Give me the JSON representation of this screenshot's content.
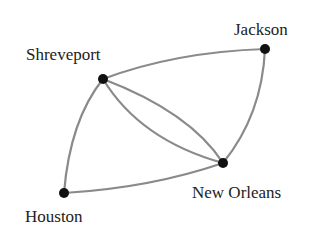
{
  "diagram": {
    "type": "graph",
    "colors": {
      "edge": "#8a8a8a",
      "node": "#111111",
      "label": "#222222",
      "background": "#ffffff"
    },
    "nodes": [
      {
        "id": "shreveport",
        "label": "Shreveport",
        "x": 103,
        "y": 79,
        "label_x": 26,
        "label_y": 60
      },
      {
        "id": "jackson",
        "label": "Jackson",
        "x": 265,
        "y": 49,
        "label_x": 234,
        "label_y": 35
      },
      {
        "id": "new_orleans",
        "label": "New Orleans",
        "x": 223,
        "y": 163,
        "label_x": 192,
        "label_y": 198
      },
      {
        "id": "houston",
        "label": "Houston",
        "x": 64,
        "y": 193,
        "label_x": 25,
        "label_y": 222
      }
    ],
    "edges": [
      {
        "from": "shreveport",
        "to": "jackson"
      },
      {
        "from": "jackson",
        "to": "new_orleans"
      },
      {
        "from": "shreveport",
        "to": "new_orleans"
      },
      {
        "from": "shreveport",
        "to": "new_orleans"
      },
      {
        "from": "shreveport",
        "to": "houston"
      },
      {
        "from": "houston",
        "to": "new_orleans"
      }
    ]
  }
}
